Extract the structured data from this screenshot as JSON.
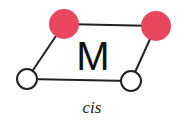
{
  "diagram": {
    "metal_label": "M",
    "caption": "cis",
    "colors": {
      "ligand_a": "#e8475e",
      "ligand_b": "#ffffff",
      "bond": "#222222",
      "outline": "#222222"
    },
    "ligands": [
      {
        "type": "red",
        "position": "top-left"
      },
      {
        "type": "red",
        "position": "top-right"
      },
      {
        "type": "white",
        "position": "bottom-left"
      },
      {
        "type": "white",
        "position": "bottom-right"
      }
    ]
  }
}
